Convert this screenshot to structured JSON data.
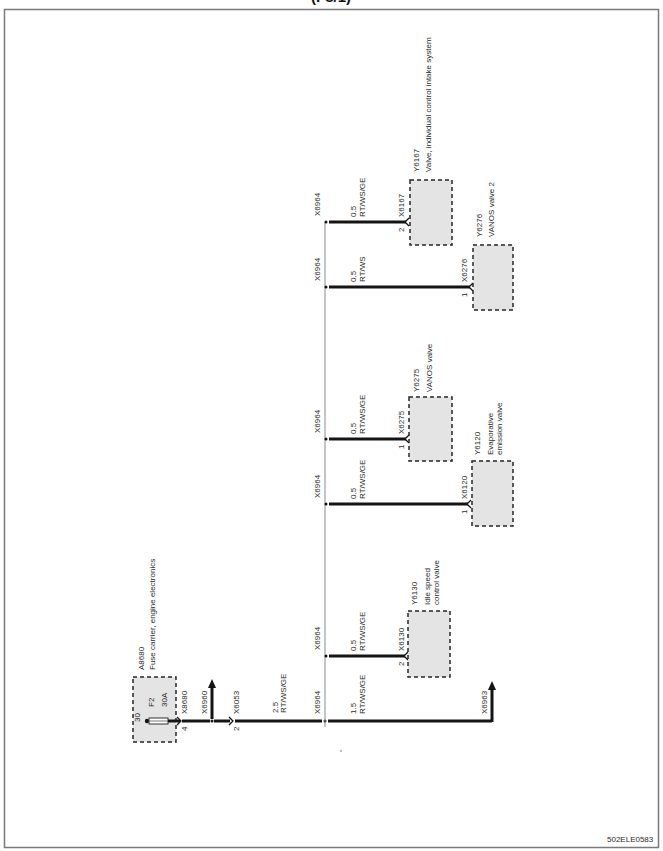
{
  "header": {
    "title": "(F8/1)"
  },
  "fuse_carrier": {
    "id": "A8680",
    "name": "Fuse carrier, engine electronics",
    "terminal": "30",
    "fuse": "F2",
    "rating": "30A"
  },
  "main_wire": {
    "connector_1": {
      "id": "X8680",
      "pin": "4"
    },
    "connector_2": {
      "id": "X6960"
    },
    "connector_3": {
      "id": "X6053",
      "pin": "2"
    },
    "segment_1": {
      "size": "2.5",
      "color": "RT/WS/GE"
    },
    "splice": "X6964",
    "segment_2": {
      "size": "1.5",
      "color": "RT/WS/GE"
    },
    "end_connector": "X6963"
  },
  "branches": [
    {
      "splice": "X6964",
      "size": "0.5",
      "color": "RT/WS/GE",
      "connector": "X6167",
      "pin": "2",
      "component": {
        "id": "Y6167",
        "name_lines": [
          "Valve, individual control intake system"
        ]
      }
    },
    {
      "splice": "X6964",
      "size": "0.5",
      "color": "RT/WS",
      "connector": "X6276",
      "pin": "1",
      "component": {
        "id": "Y6276",
        "name_lines": [
          "VANOS valve 2"
        ]
      }
    },
    {
      "splice": "X6964",
      "size": "0.5",
      "color": "RT/WS/GE",
      "connector": "X6275",
      "pin": "1",
      "component": {
        "id": "Y6275",
        "name_lines": [
          "VANOS valve"
        ]
      }
    },
    {
      "splice": "X6964",
      "size": "0.5",
      "color": "RT/WS/GE",
      "connector": "X6120",
      "pin": "1",
      "component": {
        "id": "Y6120",
        "name_lines": [
          "Evaporative",
          "emission valve"
        ]
      }
    },
    {
      "splice": "X6964",
      "size": "0.5",
      "color": "RT/WS/GE",
      "connector": "X6130",
      "pin": "2",
      "component": {
        "id": "Y6130",
        "name_lines": [
          "Idle speed",
          "control valve"
        ]
      }
    }
  ],
  "footer": {
    "code": "502ELE0583"
  },
  "colors": {
    "wire": "#141414",
    "component_fill": "#e4e4e4",
    "bus": "#8a8a8a",
    "frame": "#7a7a7a"
  }
}
